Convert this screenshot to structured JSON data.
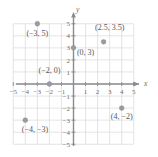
{
  "chart_data": {
    "type": "scatter",
    "title": "",
    "xlabel": "x",
    "ylabel": "y",
    "xlim": [
      -5,
      5
    ],
    "ylim": [
      -5,
      5
    ],
    "grid": true,
    "legend": "none",
    "x_ticks": [
      "-5",
      "-4",
      "-3",
      "-2",
      "-1",
      "1",
      "2",
      "3",
      "4",
      "5"
    ],
    "y_ticks": [
      "5",
      "4",
      "3",
      "2",
      "1",
      "-1",
      "-2",
      "-3",
      "-4",
      "-5"
    ],
    "points": [
      {
        "label": "(−3, 5)",
        "x": -3,
        "y": 5,
        "label_x": -3.0,
        "label_y": 4.0
      },
      {
        "label": "(2.5, 3.5)",
        "x": 2.5,
        "y": 3.5,
        "label_x": 3.0,
        "label_y": 4.5
      },
      {
        "label": "(0, 3)",
        "x": 0,
        "y": 3,
        "label_x": 1.0,
        "label_y": 2.4
      },
      {
        "label": "(−2, 0)",
        "x": -2,
        "y": 0,
        "label_x": -2.0,
        "label_y": 0.95
      },
      {
        "label": "(−4, −3)",
        "x": -4,
        "y": -3,
        "label_x": -3.2,
        "label_y": -3.95
      },
      {
        "label": "(4, −2)",
        "x": 4,
        "y": -2,
        "label_x": 4.0,
        "label_y": -2.9
      }
    ]
  },
  "colors": {
    "grid": "#d9d9dc",
    "axis": "#8a8a90",
    "point": "#9a9aa2",
    "text": "#55555a",
    "background": "#ffffff"
  }
}
